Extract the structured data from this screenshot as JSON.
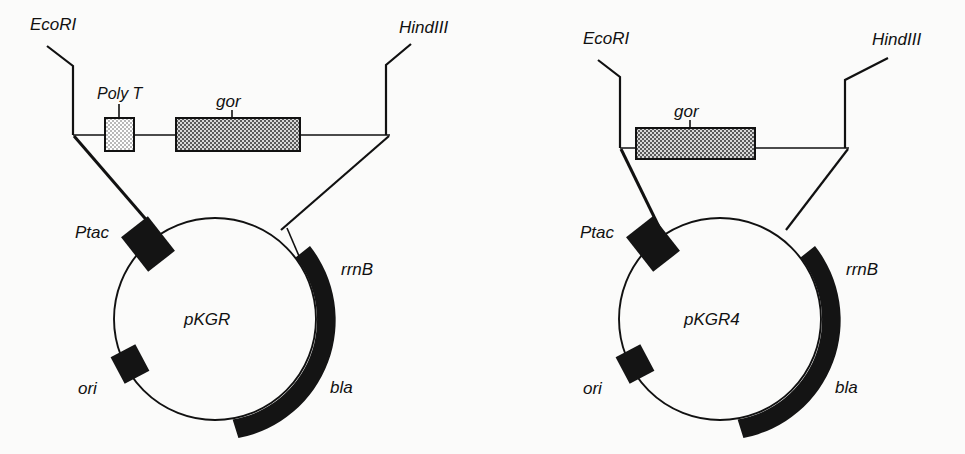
{
  "figure": {
    "kind": "plasmid-map-diagram",
    "panel_count": 2,
    "background_color": "#fbfbfa",
    "ink_color": "#141414"
  },
  "panels": [
    {
      "id": "left",
      "plasmid_name": "pKGR",
      "restriction_sites": [
        {
          "name": "EcoRI",
          "side": "left"
        },
        {
          "name": "HindIII",
          "side": "right"
        }
      ],
      "insert_elements": [
        {
          "name": "Poly  T",
          "fill": "light-checker",
          "fill_color": "#d0d0d0"
        },
        {
          "name": "gor",
          "fill": "dark-checker",
          "fill_color": "#8c8c8c"
        }
      ],
      "circle_features": [
        {
          "name": "Ptac",
          "style": "black-block",
          "position": "upper-left"
        },
        {
          "name": "ori",
          "style": "black-block",
          "position": "lower-left"
        },
        {
          "name": "bla",
          "style": "black-arc",
          "position": "right-lower"
        },
        {
          "name": "rrnB",
          "style": "arc-end-tick",
          "position": "upper-right"
        }
      ]
    },
    {
      "id": "right",
      "plasmid_name": "pKGR4",
      "restriction_sites": [
        {
          "name": "EcoRI",
          "side": "left"
        },
        {
          "name": "HindIII",
          "side": "right"
        }
      ],
      "insert_elements": [
        {
          "name": "gor",
          "fill": "dark-checker",
          "fill_color": "#8c8c8c"
        }
      ],
      "circle_features": [
        {
          "name": "Ptac",
          "style": "black-block",
          "position": "upper-left"
        },
        {
          "name": "ori",
          "style": "black-block",
          "position": "lower-left"
        },
        {
          "name": "bla",
          "style": "black-arc",
          "position": "right-lower"
        },
        {
          "name": "rrnB",
          "style": "arc-end-tick",
          "position": "upper-right"
        }
      ]
    }
  ],
  "labels": {
    "left": {
      "ecori": "EcoRI",
      "hindiii": "HindIII",
      "polyt": "Poly  T",
      "gor": "gor",
      "ptac": "Ptac",
      "ori": "ori",
      "bla": "bla",
      "rrnb": "rrnB",
      "plasmid": "pKGR"
    },
    "right": {
      "ecori": "EcoRI",
      "hindiii": "HindIII",
      "gor": "gor",
      "ptac": "Ptac",
      "ori": "ori",
      "bla": "bla",
      "rrnb": "rrnB",
      "plasmid": "pKGR4"
    }
  }
}
